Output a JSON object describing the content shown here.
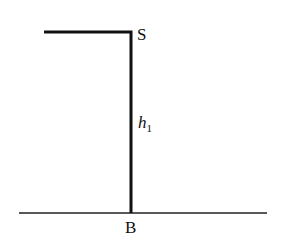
{
  "diagram": {
    "labels": {
      "top_point": "S",
      "height": "h",
      "height_subscript": "1",
      "base_point": "B"
    },
    "colors": {
      "line": "#111111",
      "background": "#ffffff"
    }
  }
}
